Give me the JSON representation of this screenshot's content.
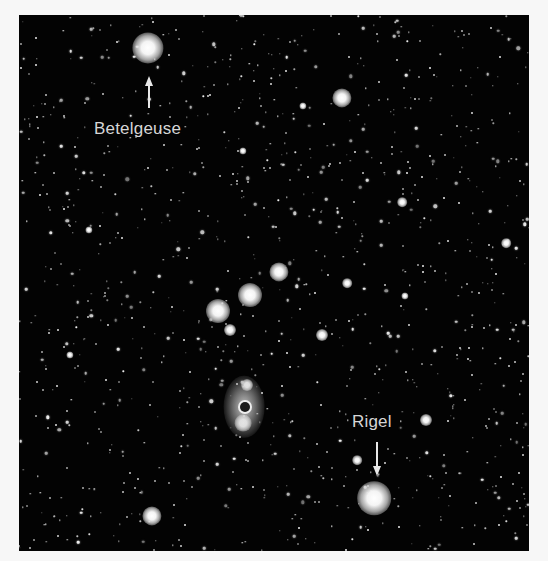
{
  "image": {
    "subject": "Orion constellation star field",
    "background_color": "#030303",
    "frame_color": "#f7f7f7",
    "label_color": "#d6d6d6",
    "arrow_color": "#e8e8e8"
  },
  "labels": [
    {
      "id": "betelgeuse",
      "text": "Betelgeuse",
      "star": {
        "x": 148,
        "y": 48,
        "r": 13
      },
      "text_pos": {
        "x": 94,
        "y": 120
      },
      "arrow": {
        "x": 149,
        "y_tip": 76,
        "y_tail": 108,
        "direction": "up"
      }
    },
    {
      "id": "rigel",
      "text": "Rigel",
      "star": {
        "x": 374,
        "y": 498,
        "r": 14
      },
      "text_pos": {
        "x": 352,
        "y": 413
      },
      "arrow": {
        "x": 377,
        "y_tip": 476,
        "y_tail": 442,
        "direction": "down"
      }
    }
  ],
  "bright_stars": [
    {
      "name": "bellatrix",
      "x": 342,
      "y": 98,
      "r": 8
    },
    {
      "name": "saiph",
      "x": 152,
      "y": 516,
      "r": 8
    },
    {
      "name": "alnitak",
      "x": 218,
      "y": 311,
      "r": 10
    },
    {
      "name": "alnilam",
      "x": 250,
      "y": 295,
      "r": 10
    },
    {
      "name": "mintaka",
      "x": 279,
      "y": 272,
      "r": 8
    },
    {
      "name": "belt-companion-1",
      "x": 230,
      "y": 330,
      "r": 5
    },
    {
      "name": "belt-companion-2",
      "x": 322,
      "y": 335,
      "r": 5
    },
    {
      "name": "belt-companion-3",
      "x": 347,
      "y": 283,
      "r": 4
    },
    {
      "name": "sword-star-top",
      "x": 247,
      "y": 385,
      "r": 5
    },
    {
      "name": "sword-star-bottom",
      "x": 243,
      "y": 423,
      "r": 7
    },
    {
      "name": "rigel-companion-1",
      "x": 357,
      "y": 460,
      "r": 4
    },
    {
      "name": "rigel-companion-2",
      "x": 426,
      "y": 420,
      "r": 5
    },
    {
      "name": "field-star-1",
      "x": 402,
      "y": 202,
      "r": 4
    },
    {
      "name": "field-star-2",
      "x": 506,
      "y": 243,
      "r": 4
    },
    {
      "name": "field-star-3",
      "x": 303,
      "y": 106,
      "r": 3
    },
    {
      "name": "field-star-4",
      "x": 89,
      "y": 230,
      "r": 3
    },
    {
      "name": "field-star-5",
      "x": 243,
      "y": 151,
      "r": 3
    },
    {
      "name": "field-star-6",
      "x": 405,
      "y": 296,
      "r": 3
    },
    {
      "name": "field-star-7",
      "x": 70,
      "y": 355,
      "r": 3
    }
  ],
  "nebula": {
    "name": "orion-nebula",
    "x": 244,
    "y": 407,
    "rx": 17,
    "ry": 26,
    "core_r": 5
  },
  "background_star_count": 1100
}
